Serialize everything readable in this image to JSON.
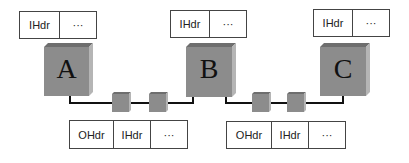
{
  "hosts": [
    {
      "id": "A",
      "label": "A"
    },
    {
      "id": "B",
      "label": "B"
    },
    {
      "id": "C",
      "label": "C"
    }
  ],
  "top_packets": [
    {
      "host": "A",
      "cells": [
        "IHdr",
        "···"
      ]
    },
    {
      "host": "B",
      "cells": [
        "IHdr",
        "···"
      ]
    },
    {
      "host": "C",
      "cells": [
        "IHdr",
        "···"
      ]
    }
  ],
  "bottom_packets": [
    {
      "link": "A-B",
      "cells": [
        "OHdr",
        "IHdr",
        "···"
      ]
    },
    {
      "link": "B-C",
      "cells": [
        "OHdr",
        "IHdr",
        "···"
      ]
    }
  ],
  "colors": {
    "cube_front": "#8c8c8c",
    "cube_top": "#6e6e6e",
    "cube_side": "#b5b5b5",
    "line": "#111111"
  }
}
